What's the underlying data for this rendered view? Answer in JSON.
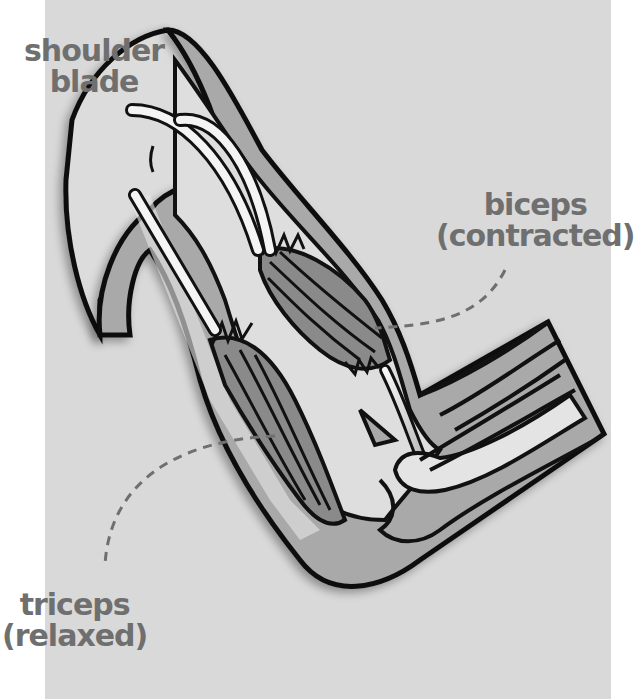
{
  "diagram": {
    "colors": {
      "background": "#d9d9d9",
      "page": "#ffffff",
      "outline": "#111111",
      "skin": "#a9a9a9",
      "bone": "#e4e4e4",
      "muscle": "#8a8a8a",
      "tendon": "#f2f2f2",
      "label_text": "#6f6f6f",
      "leader_line": "#6f6f6f"
    },
    "labels": {
      "shoulder_blade": {
        "line1": "shoulder",
        "line2": "blade"
      },
      "biceps": {
        "line1": "biceps",
        "line2": "(contracted)"
      },
      "triceps": {
        "line1": "triceps",
        "line2": "(relaxed)"
      }
    }
  }
}
